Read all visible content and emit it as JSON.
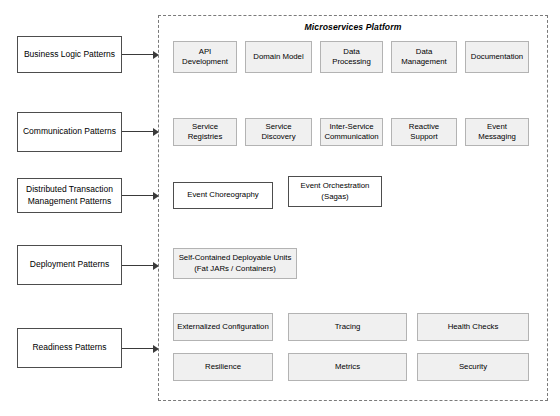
{
  "diagram": {
    "title": "Microservices Platform",
    "categories": [
      {
        "id": "business-logic-patterns",
        "label": "Business Logic Patterns"
      },
      {
        "id": "communication-patterns",
        "label": "Communication Patterns"
      },
      {
        "id": "distributed-transaction-management-patterns",
        "label": "Distributed Transaction Management Patterns"
      },
      {
        "id": "deployment-patterns",
        "label": "Deployment Patterns"
      },
      {
        "id": "readiness-patterns",
        "label": "Readiness Patterns"
      }
    ],
    "groups": [
      {
        "id": "business-logic",
        "items": [
          {
            "label": "API Development"
          },
          {
            "label": "Domain Model"
          },
          {
            "label": "Data Processing"
          },
          {
            "label": "Data Management"
          },
          {
            "label": "Documentation"
          }
        ]
      },
      {
        "id": "communication",
        "items": [
          {
            "label": "Service Registries"
          },
          {
            "label": "Service Discovery"
          },
          {
            "label": "Inter-Service Communication"
          },
          {
            "label": "Reactive Support"
          },
          {
            "label": "Event Messaging"
          }
        ]
      },
      {
        "id": "distributed-transaction",
        "items": [
          {
            "label": "Event Choreography"
          },
          {
            "label": "Event Orchestration (Sagas)"
          }
        ]
      },
      {
        "id": "deployment",
        "items": [
          {
            "label": "Self-Contained Deployable Units (Fat JARs / Containers)"
          }
        ]
      },
      {
        "id": "readiness",
        "items": [
          {
            "label": "Externalized Configuration"
          },
          {
            "label": "Tracing"
          },
          {
            "label": "Health Checks"
          },
          {
            "label": "Resilience"
          },
          {
            "label": "Metrics"
          },
          {
            "label": "Security"
          }
        ]
      }
    ],
    "colors": {
      "chip_fill": "#f0f0f0",
      "chip_border": "#b3b3b3",
      "box_border": "#4d4d4d",
      "container_border": "#7a7a7a",
      "arrow": "#3a3a3a",
      "background": "#ffffff"
    }
  }
}
